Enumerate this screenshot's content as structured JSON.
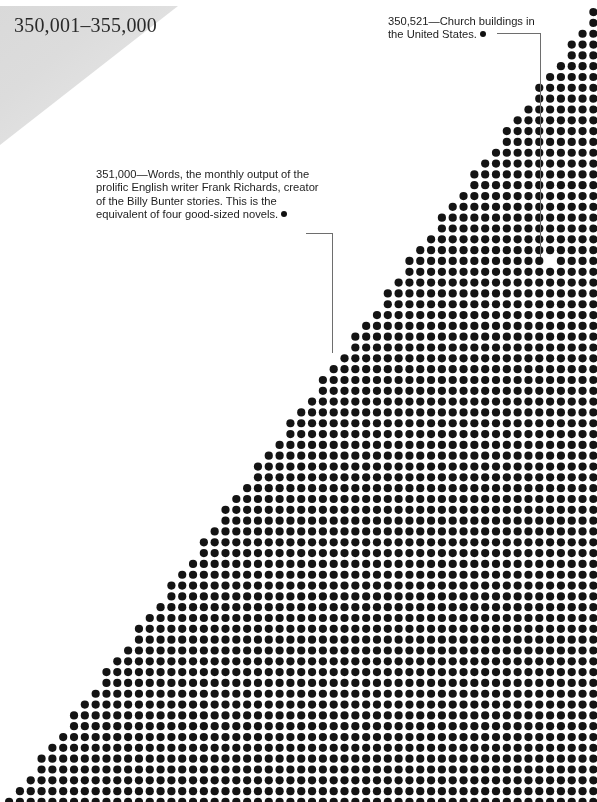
{
  "page": {
    "width": 597,
    "height": 802,
    "background_color": "#ffffff"
  },
  "header": {
    "title": "350,001–355,000",
    "wedge_color_start": "#d9d9d9",
    "wedge_color_end": "#ededed"
  },
  "annotations": [
    {
      "id": "church",
      "value": "350,521",
      "lines": [
        "350,521—Church buildings in",
        "the United States."
      ],
      "bullet": "●",
      "target_column": 50,
      "target_row": 23
    },
    {
      "id": "words",
      "value": "351,000",
      "lines": [
        "351,000—Words, the monthly output of the",
        "prolific English writer Frank Richards, creator",
        "of the Billy Bunter stories. This is the",
        "equivalent of four good-sized novels."
      ],
      "bullet": "●",
      "target_column": 30,
      "target_row": 32
    }
  ],
  "chart_data": {
    "type": "scatter",
    "title": "350,001–355,000",
    "dot_color": "#141414",
    "dot_diameter_px": 8.2,
    "grid_pitch_x_px": 10.82,
    "grid_pitch_y_px": 10.82,
    "columns": 55,
    "rows": 74,
    "origin_x_px": 5,
    "origin_y_px": 8,
    "fill_rule": "triangle: a dot is drawn at (col,row) when col >= (columns-1) - row * (columns-1)/(rows-1)",
    "highlighted_blanks": [
      {
        "column": 50,
        "row": 23,
        "label": "350,521 — Church buildings in the United States."
      },
      {
        "column": 30,
        "row": 32,
        "label": "351,000 — Words, the monthly output of Frank Richards."
      }
    ],
    "xlabel": "",
    "ylabel": "",
    "legend": [],
    "grid": false
  }
}
